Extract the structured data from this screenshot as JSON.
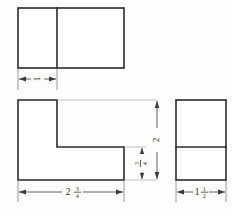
{
  "drawing": {
    "title": "Orthographic projection — three views of an L-block",
    "background_color": "#fdfdfc",
    "line_color": "#2b2b2b",
    "dimension_color": "#3a3a3a",
    "views": [
      {
        "name": "top-view",
        "shape": "rectangle-with-vertical-divider",
        "description": "Top view rectangle divided by a vertical line near the left"
      },
      {
        "name": "front-view",
        "shape": "L-shape",
        "description": "Front view showing the L profile with a notch at upper right"
      },
      {
        "name": "right-side-view",
        "shape": "rectangle-with-horizontal-divider",
        "description": "Right side view rectangle divided by a horizontal line"
      }
    ],
    "dimensions": [
      {
        "name": "width-of-left-leg",
        "whole": "1",
        "numerator": "",
        "denominator": "",
        "orientation": "horizontal",
        "view": "top-view"
      },
      {
        "name": "overall-height",
        "whole": "2",
        "numerator": "",
        "denominator": "",
        "orientation": "vertical",
        "view": "front-view"
      },
      {
        "name": "base-thickness",
        "whole": "",
        "numerator": "3",
        "denominator": "4",
        "orientation": "vertical",
        "view": "front-view"
      },
      {
        "name": "overall-width",
        "whole": "2",
        "numerator": "3",
        "denominator": "4",
        "orientation": "horizontal",
        "view": "front-view"
      },
      {
        "name": "overall-depth",
        "whole": "1",
        "numerator": "1",
        "denominator": "2",
        "orientation": "horizontal",
        "view": "right-side-view"
      }
    ]
  }
}
